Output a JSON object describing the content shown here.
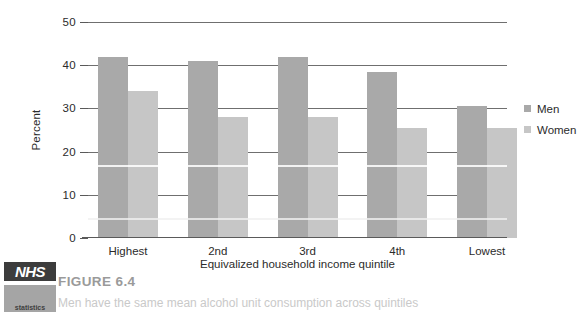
{
  "figure": {
    "number_label": "FIGURE 6.4",
    "caption": "Men have the same mean alcohol unit consumption across quintiles"
  },
  "logo": {
    "mark_text": "NHS",
    "sub_text": "statistics"
  },
  "legend": {
    "position": "right",
    "entries": [
      {
        "label": "Men",
        "color": "#a9a9a9"
      },
      {
        "label": "Women",
        "color": "#c6c6c6"
      }
    ]
  },
  "axes": {
    "y_title": "Percent",
    "x_title": "Equivalized household income quintile",
    "y_ticks": [
      "0",
      "10",
      "20",
      "30",
      "40",
      "50"
    ]
  },
  "chart_data": {
    "type": "bar",
    "title": "",
    "subtitle": "",
    "xlabel": "Equivalized household income quintile",
    "ylabel": "Percent",
    "ylim": [
      0,
      50
    ],
    "yticks": [
      0,
      10,
      20,
      30,
      40,
      50
    ],
    "grid": true,
    "legend_position": "right",
    "categories": [
      "Highest",
      "2nd",
      "3rd",
      "4th",
      "Lowest"
    ],
    "series": [
      {
        "name": "Men",
        "color": "#a9a9a9",
        "values": [
          42.0,
          41.0,
          42.0,
          38.5,
          30.5
        ]
      },
      {
        "name": "Women",
        "color": "#c6c6c6",
        "values": [
          34.0,
          28.0,
          28.0,
          25.5,
          25.5
        ]
      }
    ]
  }
}
